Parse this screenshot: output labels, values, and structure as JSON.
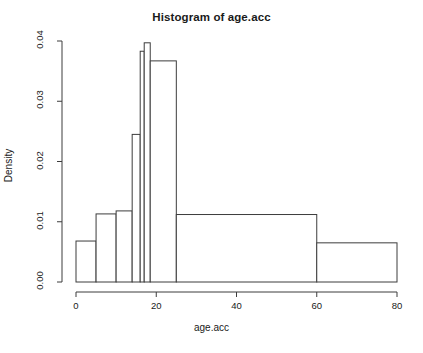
{
  "title": "Histogram of age.acc",
  "axes": {
    "x_label": "age.acc",
    "y_label": "Density",
    "x_ticks": [
      "0",
      "20",
      "40",
      "60",
      "80"
    ],
    "y_ticks": [
      "0.00",
      "0.01",
      "0.02",
      "0.03",
      "0.04"
    ]
  },
  "chart_data": {
    "type": "bar",
    "title": "Histogram of age.acc",
    "xlabel": "age.acc",
    "ylabel": "Density",
    "xlim": [
      0,
      80
    ],
    "ylim": [
      0,
      0.04
    ],
    "grid": false,
    "legend": "none",
    "bar_style": {
      "fill": "#ffffff",
      "edge": "#3c3c3c",
      "edge_width": 1
    },
    "x_tick_values": [
      0,
      20,
      40,
      60,
      80
    ],
    "y_tick_values": [
      0.0,
      0.01,
      0.02,
      0.03,
      0.04
    ],
    "bins": [
      {
        "left": 0,
        "right": 5,
        "density": 0.0068
      },
      {
        "left": 5,
        "right": 10,
        "density": 0.0113
      },
      {
        "left": 10,
        "right": 14,
        "density": 0.0118
      },
      {
        "left": 14,
        "right": 16,
        "density": 0.0245
      },
      {
        "left": 16,
        "right": 17,
        "density": 0.0383
      },
      {
        "left": 17,
        "right": 18.5,
        "density": 0.0397
      },
      {
        "left": 18.5,
        "right": 25,
        "density": 0.0367
      },
      {
        "left": 25,
        "right": 60,
        "density": 0.0112
      },
      {
        "left": 60,
        "right": 80,
        "density": 0.0065
      }
    ],
    "categories": [
      "0-5",
      "5-10",
      "10-14",
      "14-16",
      "16-17",
      "17-18.5",
      "18.5-25",
      "25-60",
      "60-80"
    ],
    "values": [
      0.0068,
      0.0113,
      0.0118,
      0.0245,
      0.0383,
      0.0397,
      0.0367,
      0.0112,
      0.0065
    ]
  }
}
